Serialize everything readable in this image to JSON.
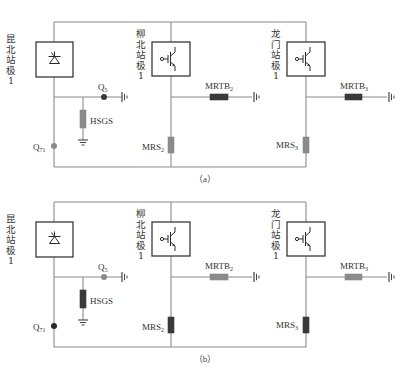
{
  "figure": {
    "panels": [
      {
        "caption": "（a）",
        "stations": [
          {
            "label_chars": [
              "昆",
              "北",
              "站",
              "极",
              "1"
            ],
            "device": "thyristor-valve"
          },
          {
            "label_chars": [
              "柳",
              "北",
              "站",
              "极",
              "1"
            ],
            "device": "igbt-valve"
          },
          {
            "label_chars": [
              "龙",
              "门",
              "站",
              "极",
              "1"
            ],
            "device": "igbt-valve"
          }
        ],
        "components": {
          "q5": {
            "label": "Q",
            "sub": "5",
            "state": "closed",
            "color": "#3a3a3a"
          },
          "q71": {
            "label": "Q",
            "sub": "71",
            "state": "open",
            "color": "#8a8a8a"
          },
          "hsgs": {
            "label": "HSGS",
            "state": "open",
            "color": "#8a8a8a"
          },
          "mrtb2": {
            "label": "MRTB",
            "sub": "2",
            "state": "closed",
            "color": "#3a3a3a"
          },
          "mrtb3": {
            "label": "MRTB",
            "sub": "3",
            "state": "closed",
            "color": "#3a3a3a"
          },
          "mrs2": {
            "label": "MRS",
            "sub": "2",
            "state": "open",
            "color": "#8a8a8a"
          },
          "mrs3": {
            "label": "MRS",
            "sub": "3",
            "state": "open",
            "color": "#8a8a8a"
          }
        }
      },
      {
        "caption": "（b）",
        "stations": [
          {
            "label_chars": [
              "昆",
              "北",
              "站",
              "极",
              "1"
            ],
            "device": "thyristor-valve"
          },
          {
            "label_chars": [
              "柳",
              "北",
              "站",
              "极",
              "1"
            ],
            "device": "igbt-valve"
          },
          {
            "label_chars": [
              "龙",
              "门",
              "站",
              "极",
              "1"
            ],
            "device": "igbt-valve"
          }
        ],
        "components": {
          "q5": {
            "label": "Q",
            "sub": "5",
            "state": "open",
            "color": "#8a8a8a"
          },
          "q71": {
            "label": "Q",
            "sub": "71",
            "state": "closed",
            "color": "#2a2a2a"
          },
          "hsgs": {
            "label": "HSGS",
            "state": "closed",
            "color": "#3a3a3a"
          },
          "mrtb2": {
            "label": "MRTB",
            "sub": "2",
            "state": "open",
            "color": "#8a8a8a"
          },
          "mrtb3": {
            "label": "MRTB",
            "sub": "3",
            "state": "open",
            "color": "#8a8a8a"
          },
          "mrs2": {
            "label": "MRS",
            "sub": "2",
            "state": "closed",
            "color": "#3a3a3a"
          },
          "mrs3": {
            "label": "MRS",
            "sub": "3",
            "state": "closed",
            "color": "#3a3a3a"
          }
        }
      }
    ]
  }
}
